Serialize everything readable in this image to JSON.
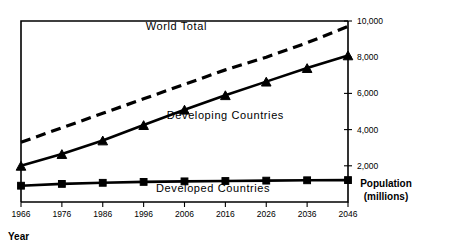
{
  "chart_data": {
    "type": "line",
    "title": "",
    "xlabel": "Year",
    "ylabel": "Population (millions)",
    "ylabel_line1": "Population",
    "ylabel_line2": "(millions)",
    "x": [
      1966,
      1976,
      1986,
      1996,
      2006,
      2016,
      2026,
      2036,
      2046
    ],
    "xtick_labels": [
      "1966",
      "1976",
      "1986",
      "1996",
      "2006",
      "2016",
      "2026",
      "2036",
      "2046"
    ],
    "ytick_labels": [
      "2,000",
      "4,000",
      "6,000",
      "8,000",
      "10,000"
    ],
    "ytick_values": [
      2000,
      4000,
      6000,
      8000,
      10000
    ],
    "ylim": [
      0,
      10000
    ],
    "xlim": [
      1966,
      2046
    ],
    "grid": false,
    "legend_position": "inline-annotations",
    "y_axis_side": "right",
    "series": [
      {
        "name": "World Total",
        "label": "World Total",
        "style": "dashed",
        "marker": "none",
        "color": "#000000",
        "values": [
          3300,
          4100,
          4900,
          5700,
          6500,
          7300,
          8000,
          8800,
          9700
        ]
      },
      {
        "name": "Developing Countries",
        "label": "Developing Countries",
        "style": "solid",
        "marker": "triangle",
        "color": "#000000",
        "values": [
          2000,
          2650,
          3400,
          4250,
          5100,
          5900,
          6650,
          7400,
          8100
        ]
      },
      {
        "name": "Developed Countries",
        "label": "Developed Countries",
        "style": "solid",
        "marker": "square",
        "color": "#000000",
        "values": [
          900,
          1000,
          1060,
          1110,
          1140,
          1160,
          1180,
          1200,
          1210
        ]
      }
    ],
    "annotations": [
      {
        "text": "World Total",
        "x": 2004,
        "y": 9500
      },
      {
        "text": "Developing Countries",
        "x": 2016,
        "y": 4600
      },
      {
        "text": "Developed Countries",
        "x": 2013,
        "y": 550
      }
    ]
  }
}
